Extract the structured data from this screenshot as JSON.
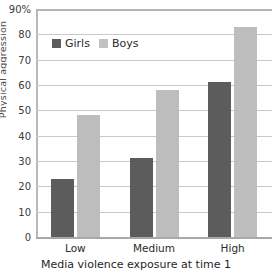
{
  "chart_data": {
    "type": "bar",
    "title": "",
    "xlabel": "Media violence exposure at time 1",
    "ylabel": "",
    "categories": [
      "Low",
      "Medium",
      "High"
    ],
    "series": [
      {
        "name": "Girls",
        "values": [
          23,
          31,
          61
        ],
        "color": "#5c5c5c"
      },
      {
        "name": "Boys",
        "values": [
          48,
          58,
          83
        ],
        "color": "#bdbdbd"
      }
    ],
    "ylim": [
      0,
      90
    ],
    "ytick_labels": [
      "90%",
      "80",
      "70",
      "60",
      "50",
      "40",
      "30",
      "20",
      "10",
      "0"
    ],
    "ytick_values": [
      90,
      80,
      70,
      60,
      50,
      40,
      30,
      20,
      10,
      0
    ],
    "grid": true,
    "legend_position": "top-left"
  },
  "axis": {
    "edge_fragment_label": "Physical aggression"
  }
}
